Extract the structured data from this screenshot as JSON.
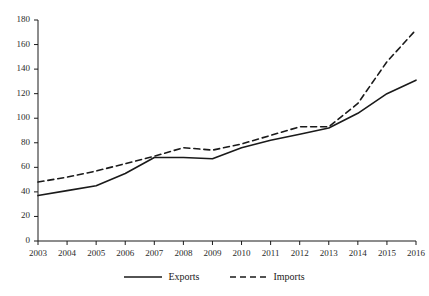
{
  "chart_data": {
    "type": "line",
    "title": "",
    "subtitle": "",
    "xlabel": "",
    "ylabel": "",
    "x": [
      2003,
      2004,
      2005,
      2006,
      2007,
      2008,
      2009,
      2010,
      2011,
      2012,
      2013,
      2014,
      2015,
      2016
    ],
    "categories": [
      "2003",
      "2004",
      "2005",
      "2006",
      "2007",
      "2008",
      "2009",
      "2010",
      "2011",
      "2012",
      "2013",
      "2014",
      "2015",
      "2016"
    ],
    "series": [
      {
        "name": "Exports",
        "style": "solid",
        "color": "#1a1a1a",
        "values": [
          37,
          41,
          45,
          55,
          68,
          68,
          67,
          76,
          82,
          87,
          92,
          104,
          120,
          131
        ]
      },
      {
        "name": "Imports",
        "style": "dashed",
        "color": "#1a1a1a",
        "values": [
          48,
          52,
          57,
          63,
          69,
          76,
          74,
          79,
          86,
          93,
          93,
          112,
          146,
          172
        ]
      }
    ],
    "ylim": [
      0,
      180
    ],
    "yticks": [
      0,
      20,
      40,
      60,
      80,
      100,
      120,
      140,
      160,
      180
    ],
    "ytick_labels": [
      "0",
      "20",
      "40",
      "60",
      "80",
      "100",
      "120",
      "140",
      "160",
      "180"
    ],
    "xlim": [
      2003,
      2016
    ],
    "xticks": [
      2003,
      2004,
      2005,
      2006,
      2007,
      2008,
      2009,
      2010,
      2011,
      2012,
      2013,
      2014,
      2015,
      2016
    ],
    "xtick_labels": [
      "2003",
      "2004",
      "2005",
      "2006",
      "2007",
      "2008",
      "2009",
      "2010",
      "2011",
      "2012",
      "2013",
      "2014",
      "2015",
      "2016"
    ],
    "grid": false,
    "legend_position": "bottom",
    "legend": [
      "Exports",
      "Imports"
    ],
    "annotations": []
  },
  "legend": {
    "exports_label": "Exports",
    "imports_label": "Imports"
  },
  "axes": {
    "axis_color": "#1a1a1a"
  }
}
